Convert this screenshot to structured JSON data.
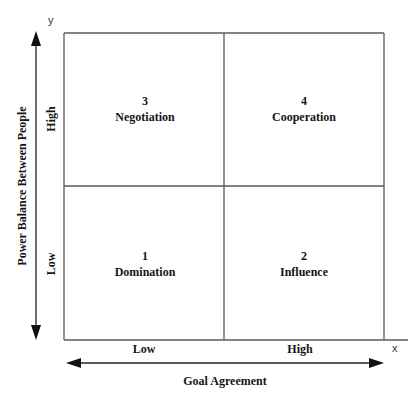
{
  "diagram": {
    "type": "2x2 matrix",
    "x_axis": {
      "letter": "x",
      "title": "Goal Agreement",
      "low_label": "Low",
      "high_label": "High"
    },
    "y_axis": {
      "letter": "y",
      "title": "Power Balance Between People",
      "low_label": "Low",
      "high_label": "High"
    },
    "quadrants": [
      {
        "position": "top-left",
        "number": "3",
        "label": "Negotiation"
      },
      {
        "position": "top-right",
        "number": "4",
        "label": "Cooperation"
      },
      {
        "position": "bottom-left",
        "number": "1",
        "label": "Domination"
      },
      {
        "position": "bottom-right",
        "number": "2",
        "label": "Influence"
      }
    ],
    "colors": {
      "line": "#555555",
      "arrow": "#111111",
      "text": "#151515",
      "background": "#ffffff"
    }
  }
}
